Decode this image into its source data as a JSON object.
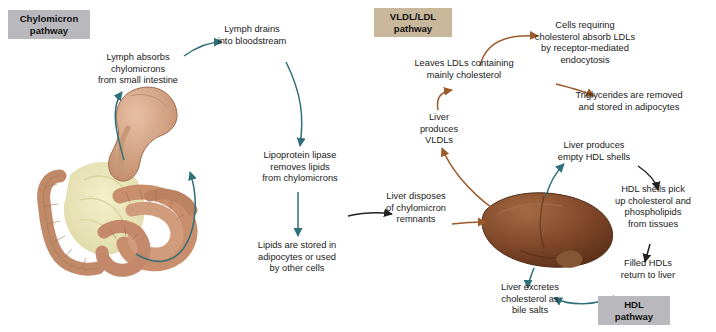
{
  "diagram": {
    "colors": {
      "arrow_teal": "#2f6f7a",
      "arrow_brown": "#9c5a2a",
      "box_gray": "#b9b9bd",
      "box_tan": "#c8b79a",
      "text": "#1a1a1a",
      "organ_tan": "#c99a7a",
      "liver_brown": "#7b4a2e"
    },
    "pathway_boxes": [
      {
        "id": "chylomicron",
        "label": "Chylomicron\npathway",
        "style": "box-gray"
      },
      {
        "id": "vldl_ldl",
        "label": "VLDL/LDL\npathway",
        "style": "box-tan"
      },
      {
        "id": "hdl",
        "label": "HDL\npathway",
        "style": "box-gray"
      }
    ],
    "labels": [
      {
        "id": "lymph-absorbs",
        "text": "Lymph absorbs\nchylomicrons\nfrom small intestine"
      },
      {
        "id": "lymph-drains",
        "text": "Lymph drains\ninto bloodstream"
      },
      {
        "id": "lipoprotein-lipase",
        "text": "Lipoprotein lipase\nremoves lipids\nfrom chylomicrons"
      },
      {
        "id": "lipids-stored",
        "text": "Lipids are stored in\nadipocytes or used\nby other cells"
      },
      {
        "id": "liver-disposes",
        "text": "Liver disposes\nof chylomicron\nremnants"
      },
      {
        "id": "liver-produces-vldls",
        "text": "Liver\nproduces\nVLDLs"
      },
      {
        "id": "leaves-ldls",
        "text": "Leaves LDLs containing\nmainly cholesterol"
      },
      {
        "id": "cells-requiring",
        "text": "Cells requiring\ncholesterol absorb LDLs\nby receptor-mediated\nendocytosis"
      },
      {
        "id": "triglycerides-removed",
        "text": "Triglycerides are removed\nand stored in adipocytes"
      },
      {
        "id": "liver-produces-hdl",
        "text": "Liver produces\nempty HDL shells"
      },
      {
        "id": "hdl-shells-pick-up",
        "text": "HDL shells pick\nup cholesterol and\nphospholipids\nfrom tissues"
      },
      {
        "id": "filled-hdls",
        "text": "Filled HDLs\nreturn to liver"
      },
      {
        "id": "liver-excretes",
        "text": "Liver excretes\ncholesterol as\nbile salts"
      }
    ]
  }
}
